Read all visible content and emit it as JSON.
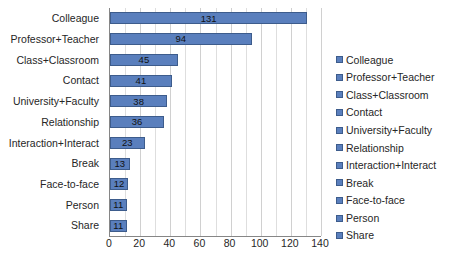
{
  "chart_data": {
    "type": "bar",
    "orientation": "horizontal",
    "title": "",
    "xlabel": "",
    "ylabel": "",
    "categories": [
      "Colleague",
      "Professor+Teacher",
      "Class+Classroom",
      "Contact",
      "University+Faculty",
      "Relationship",
      "Interaction+Interact",
      "Break",
      "Face-to-face",
      "Person",
      "Share"
    ],
    "values": [
      131,
      94,
      45,
      41,
      38,
      36,
      23,
      13,
      12,
      11,
      11
    ],
    "data_labels": [
      "131",
      "94",
      "45",
      "41",
      "38",
      "36",
      "23",
      "13",
      "12",
      "11",
      "11"
    ],
    "xlim": [
      0,
      140
    ],
    "xticks": [
      0,
      20,
      40,
      60,
      80,
      100,
      120,
      140
    ],
    "xtick_labels": [
      "0",
      "20",
      "40",
      "60",
      "80",
      "100",
      "120",
      "140"
    ],
    "minor_tick_interval": 10,
    "grid": true,
    "grid_axis": "x",
    "legend_position": "right",
    "legend_entries": [
      "Colleague",
      "Professor+Teacher",
      "Class+Classroom",
      "Contact",
      "University+Faculty",
      "Relationship",
      "Interaction+Interact",
      "Break",
      "Face-to-face",
      "Person",
      "Share"
    ],
    "colors": {
      "bar_fill": "#5a7fbd",
      "bar_border": "#3d5c8c",
      "gridline": "#dedede",
      "axis_line": "#868686",
      "text": "#262626",
      "background": "#ffffff"
    }
  }
}
